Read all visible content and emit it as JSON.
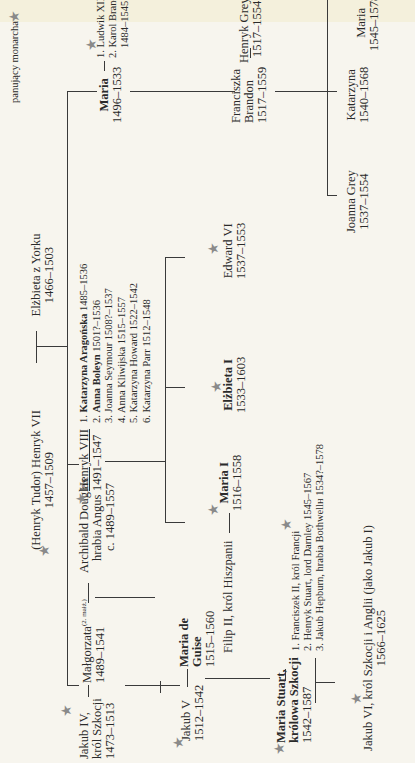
{
  "legend": {
    "star_label": "panujący monarcha"
  },
  "root": {
    "henry_vii": {
      "name": "(Henryk Tudor) Henryk VII",
      "dates": "1457–1509"
    },
    "elizabeth_york": {
      "name": "Elżbieta z Yorku",
      "dates": "1466–1503"
    }
  },
  "gen2": {
    "margaret": {
      "name": "Małgorzata",
      "note": "(2. małż.)",
      "dates": "1489–1541"
    },
    "james_iv": {
      "name": "Jakub IV,",
      "title": "król Szkocji",
      "dates": "1473–1513"
    },
    "archibald": {
      "name": "Archibald Douglas",
      "title": "hrabia Angus",
      "dates": "c. 1489–1557"
    },
    "henry_viii": {
      "name": "Henryk VIII",
      "dates": "1491–1547"
    },
    "henry_viii_wives": [
      {
        "n": "1.",
        "name": "Katarzyna Aragońska",
        "dates": "1485–1536",
        "bold": true
      },
      {
        "n": "2.",
        "name": "Anna Boleyn",
        "dates": "1501?–1536",
        "bold": true
      },
      {
        "n": "3.",
        "name": "Joanna Seymour",
        "dates": "1508?–1537",
        "bold": false
      },
      {
        "n": "4.",
        "name": "Anna Kliwijska",
        "dates": "1515–1557",
        "bold": false
      },
      {
        "n": "5.",
        "name": "Katarzyna Howard",
        "dates": "1522–1542",
        "bold": false
      },
      {
        "n": "6.",
        "name": "Katarzyna Parr",
        "dates": "1512–1548",
        "bold": false
      }
    ],
    "mary_tudor": {
      "name": "Maria",
      "dates": "1496–1533"
    },
    "mary_tudor_husbands": [
      {
        "line": "1. Ludwik XII, król Francji"
      },
      {
        "line": "2. Karol Brandon"
      },
      {
        "line": "1484–1545"
      }
    ]
  },
  "gen3": {
    "james_v": {
      "name": "Jakub V",
      "dates": "1512–1542"
    },
    "mary_guise": {
      "name": "Maria de",
      "name2": "Guise",
      "dates": "1515–1560"
    },
    "philip_ii": {
      "name": "Filip II, król Hiszpanii"
    },
    "mary_i": {
      "name": "Maria I",
      "dates": "1516–1558"
    },
    "elizabeth_i": {
      "name": "Elżbieta I",
      "dates": "1533–1603"
    },
    "edward_vi": {
      "name": "Edward VI",
      "dates": "1537–1553"
    },
    "frances": {
      "name": "Franciszka",
      "name2": "Brandon",
      "dates": "1517–1559"
    },
    "henry_grey": {
      "name": "Henryk Grey",
      "dates": "1517–1554"
    }
  },
  "gen4": {
    "mary_stuart": {
      "name": "Maria Stuart,",
      "title": "królowa Szkocji",
      "dates": "1542–1587"
    },
    "mary_stuart_husbands": [
      {
        "line": "1. Franciszek II, król Francji"
      },
      {
        "line": "2. Henryk Stuart, lord Darnley 1545–1567"
      },
      {
        "line": "3. Jakub Hepburn, hrabia Bothwellн 1534?–1578"
      }
    ],
    "jane_grey": {
      "name": "Joanna Grey",
      "dates": "1537–1554"
    },
    "katherine_grey": {
      "name": "Katarzyna",
      "dates": "1540–1568"
    },
    "mary_grey": {
      "name": "Maria",
      "dates": "1545–1578"
    }
  },
  "gen5": {
    "james_vi": {
      "name": "Jakub VI, król Szkocji i Anglii (jako Jakub I)",
      "dates": "1566–1625"
    }
  },
  "icons": {
    "star": "★"
  }
}
